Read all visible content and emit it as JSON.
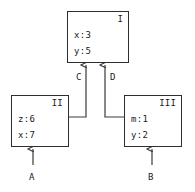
{
  "diagram": {
    "type": "dataflow-block-diagram",
    "nodes": [
      {
        "id": "I",
        "title": "I",
        "fields": [
          "x:3",
          "y:5"
        ],
        "box": {
          "x": 67,
          "y": 11,
          "w": 62,
          "h": 52
        }
      },
      {
        "id": "II",
        "title": "II",
        "fields": [
          "z:6",
          "x:7"
        ],
        "box": {
          "x": 11,
          "y": 95,
          "w": 58,
          "h": 52
        }
      },
      {
        "id": "III",
        "title": "III",
        "fields": [
          "m:1",
          "y:2"
        ],
        "box": {
          "x": 124,
          "y": 95,
          "w": 58,
          "h": 52
        }
      }
    ],
    "edges": [
      {
        "label": "C",
        "from": "II",
        "to": "I",
        "label_x": 76,
        "label_y": 72
      },
      {
        "label": "D",
        "from": "III",
        "to": "I",
        "label_x": 110,
        "label_y": 72
      },
      {
        "label": "A",
        "from": "external",
        "to": "II",
        "label_x": 29,
        "label_y": 172
      },
      {
        "label": "B",
        "from": "external",
        "to": "III",
        "label_x": 148,
        "label_y": 172
      }
    ],
    "colors": {
      "stroke": "#2e2e2e",
      "line": "#3a3a3a",
      "text": "#1a1a1a",
      "background": "#ffffff"
    }
  }
}
